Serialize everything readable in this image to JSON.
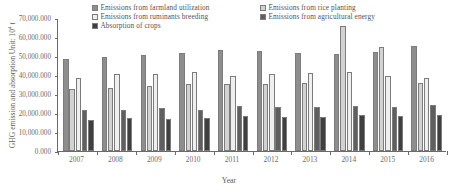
{
  "chart_data": {
    "type": "bar",
    "title": "",
    "xlabel": "Year",
    "ylabel": "GHG emission and absorption Unit: 10⁴ t",
    "ylabel_main": "GHG emission and absorption Unit: 10",
    "ylabel_sup": "4",
    "ylabel_tail": " t",
    "categories": [
      "2007",
      "2008",
      "2009",
      "2010",
      "2011",
      "2012",
      "2013",
      "2014",
      "2015",
      "2016"
    ],
    "ylim": [
      0,
      70000
    ],
    "ytick_values": [
      0,
      10000,
      20000,
      30000,
      40000,
      50000,
      60000,
      70000
    ],
    "ytick_labels": [
      "0.000",
      "10,000.000",
      "20,000.000",
      "30,000.000",
      "40,000.000",
      "50,000.000",
      "60,000.000",
      "70,000.000"
    ],
    "grid": false,
    "legend_position": "top",
    "series": [
      {
        "name": "Emissions from farmland utilization",
        "color": "#8e8e8e",
        "values": [
          48500,
          49500,
          50500,
          51500,
          53000,
          52500,
          51500,
          51000,
          52000,
          55500
        ]
      },
      {
        "name": "Emissions from rice planting",
        "color": "#d2d2d2",
        "values": [
          32500,
          33000,
          34000,
          35500,
          35500,
          35500,
          36000,
          66000,
          54500,
          36000
        ]
      },
      {
        "name": "Emissions from ruminants breeding",
        "color": "#efefef",
        "values": [
          38500,
          40500,
          40500,
          41500,
          39500,
          40500,
          41000,
          41500,
          39500,
          38500
        ]
      },
      {
        "name": "Emissions from agricultural energy",
        "color": "#5f5f5f",
        "values": [
          21500,
          21500,
          22500,
          21500,
          23500,
          23000,
          23000,
          23500,
          23000,
          24000
        ]
      },
      {
        "name": "Absorption of crops",
        "color": "#3f3f3f",
        "values": [
          16500,
          17500,
          17000,
          17500,
          18500,
          18000,
          18000,
          19000,
          18500,
          19000
        ]
      }
    ]
  }
}
